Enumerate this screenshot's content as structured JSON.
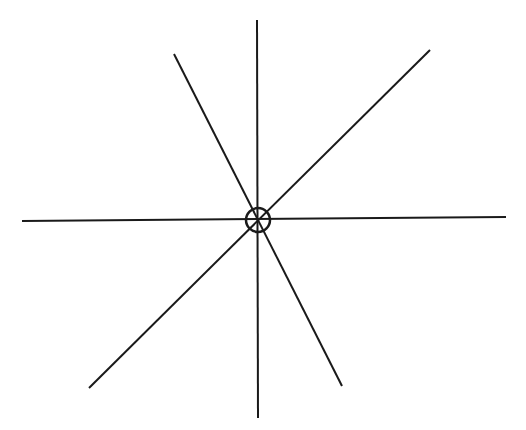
{
  "diagram": {
    "type": "radial-lines-with-center-circle",
    "stroke_color": "#1a1a1a",
    "background": "#ffffff",
    "stroke_width": 2,
    "center": {
      "x": 258,
      "y": 220,
      "radius": 12
    },
    "lines": [
      {
        "name": "vertical-line",
        "x1": 257,
        "y1": 20,
        "x2": 258,
        "y2": 418
      },
      {
        "name": "horizontal-line",
        "x1": 22,
        "y1": 221,
        "x2": 506,
        "y2": 217
      },
      {
        "name": "diagonal-ne-sw-line",
        "x1": 430,
        "y1": 50,
        "x2": 89,
        "y2": 388
      },
      {
        "name": "diagonal-nw-se-line",
        "x1": 174,
        "y1": 54,
        "x2": 342,
        "y2": 386
      }
    ]
  }
}
